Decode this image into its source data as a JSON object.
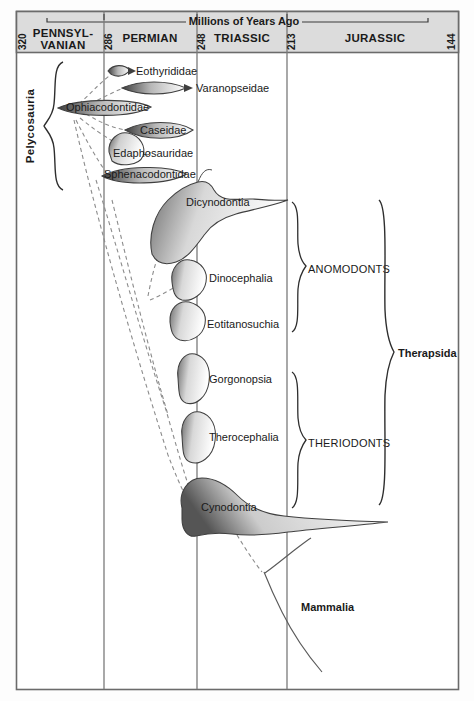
{
  "figure": {
    "title": "Millions of Years Ago",
    "type": "phylogenetic-spindle-diagram",
    "background_color": "#ffffff",
    "frame_color": "#6b6b6b",
    "header_fill": "#dcdcdc",
    "line_color": "#4a4a4a",
    "text_color": "#1a1a1a"
  },
  "timescale": {
    "axis_label": "Millions of Years Ago",
    "ticks": [
      "320",
      "286",
      "248",
      "213",
      "144"
    ],
    "tick_x": [
      16,
      104,
      197,
      287,
      459
    ],
    "periods": [
      {
        "name": "PENNSYL-\nVANIAN",
        "line1": "PENNSYL-",
        "line2": "VANIAN",
        "start": "320",
        "end": "286"
      },
      {
        "name": "PERMIAN",
        "line1": "PERMIAN",
        "line2": "",
        "start": "286",
        "end": "248"
      },
      {
        "name": "TRIASSIC",
        "line1": "TRIASSIC",
        "line2": "",
        "start": "248",
        "end": "213"
      },
      {
        "name": "JURASSIC",
        "line1": "JURASSIC",
        "line2": "",
        "start": "213",
        "end": "144"
      }
    ]
  },
  "taxa": [
    {
      "id": "eothyrididae",
      "label": "Eothyrididae",
      "label_x": 134,
      "label_y": 75,
      "anchor": "start"
    },
    {
      "id": "varanopseidae",
      "label": "Varanopseidae",
      "label_x": 194,
      "label_y": 92,
      "anchor": "start"
    },
    {
      "id": "ophiacodontidae",
      "label": "Ophiacodontidae",
      "label_x": 66,
      "label_y": 110,
      "anchor": "start"
    },
    {
      "id": "caseidae",
      "label": "Caseidae",
      "label_x": 137,
      "label_y": 132,
      "anchor": "start"
    },
    {
      "id": "edaphosauridae",
      "label": "Edaphosauridae",
      "label_x": 112,
      "label_y": 156,
      "anchor": "start"
    },
    {
      "id": "sphenacodontidae",
      "label": "Sphenacodontidae",
      "label_x": 103,
      "label_y": 177,
      "anchor": "start"
    },
    {
      "id": "dicynodontia",
      "label": "Dicynodontia",
      "label_x": 186,
      "label_y": 205,
      "anchor": "start"
    },
    {
      "id": "dinocephalia",
      "label": "Dinocephalia",
      "label_x": 208,
      "label_y": 281,
      "anchor": "start"
    },
    {
      "id": "eotitanosuchia",
      "label": "Eotitanosuchia",
      "label_x": 206,
      "label_y": 327,
      "anchor": "start"
    },
    {
      "id": "gorgonopsia",
      "label": "Gorgonopsia",
      "label_x": 208,
      "label_y": 382,
      "anchor": "start"
    },
    {
      "id": "therocephalia",
      "label": "Therocephalia",
      "label_x": 208,
      "label_y": 440,
      "anchor": "start"
    },
    {
      "id": "cynodontia",
      "label": "Cynodontia",
      "label_x": 200,
      "label_y": 510,
      "anchor": "start"
    },
    {
      "id": "mammalia",
      "label": "Mammalia",
      "label_x": 300,
      "label_y": 610,
      "anchor": "start"
    }
  ],
  "brackets": [
    {
      "id": "pelycosauria",
      "label": "Pelycosauria",
      "rotated": true,
      "bold": true,
      "label_x": 34,
      "label_y": 126
    },
    {
      "id": "anomodonts",
      "label": "ANOMODONTS",
      "rotated": false,
      "bold": false,
      "label_x": 303,
      "label_y": 269
    },
    {
      "id": "theriodonts",
      "label": "THERIODONTS",
      "rotated": false,
      "bold": false,
      "label_x": 303,
      "label_y": 442
    },
    {
      "id": "therapsida",
      "label": "Therapsida",
      "rotated": false,
      "bold": true,
      "label_x": 392,
      "label_y": 357
    }
  ]
}
